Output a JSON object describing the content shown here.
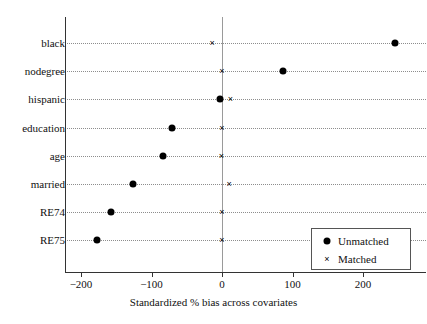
{
  "chart_data": {
    "type": "scatter",
    "title": "",
    "xlabel": "Standardized % bias across covariates",
    "ylabel": "",
    "xlim": [
      -225,
      275
    ],
    "ylim": [
      0,
      9
    ],
    "grid": "horizontal-dotted",
    "legend_position": "bottom-right",
    "categories": [
      "black",
      "nodegree",
      "hispanic",
      "education",
      "age",
      "married",
      "RE74",
      "RE75"
    ],
    "xticks": [
      -200,
      -100,
      0,
      100,
      200
    ],
    "xtick_labels": [
      "−200",
      "−100",
      "0",
      "100",
      "200"
    ],
    "reference_line": 0,
    "series": [
      {
        "name": "Unmatched",
        "marker": "filled-circle",
        "color": "#000000",
        "values": [
          245,
          87,
          -3,
          -71,
          -84,
          -126,
          -158,
          -177
        ]
      },
      {
        "name": "Matched",
        "marker": "cross-x",
        "color": "#000000",
        "values": [
          -14,
          0,
          12,
          0,
          -1,
          10,
          0,
          0
        ]
      }
    ]
  },
  "legend": {
    "entries": [
      {
        "label": "Unmatched",
        "symbol": "filled-circle-icon"
      },
      {
        "label": "Matched",
        "symbol": "cross-x-icon"
      }
    ]
  },
  "colors": {
    "marker": "#000000",
    "axis": "#333333",
    "grid": "#8d8d8d",
    "zero_line": "#9a9a9a",
    "background": "#ffffff"
  }
}
